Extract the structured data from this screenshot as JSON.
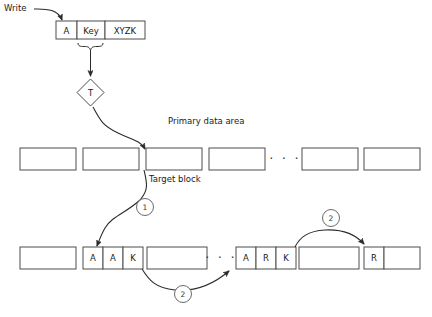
{
  "diagram": {
    "title_labels": {
      "write": "Write",
      "primary_data_area": "Primary data area",
      "target_block": "Target block"
    },
    "input_record": {
      "cells": [
        {
          "label": "A"
        },
        {
          "label": "Key"
        },
        {
          "label": "XYZK"
        }
      ]
    },
    "transform": {
      "label": "T"
    },
    "primary_row": {
      "blocks": [
        "",
        "",
        "",
        "",
        "",
        ""
      ],
      "ellipsis": "· · ·"
    },
    "overflow_row": {
      "ellipsis": "· · ·",
      "group_a": {
        "cells": [
          "A",
          "A",
          "K"
        ]
      },
      "group_b": {
        "cells": [
          "A",
          "R",
          "K"
        ]
      },
      "group_c": {
        "cells": [
          "R"
        ]
      }
    },
    "step_markers": [
      {
        "label": "1"
      },
      {
        "label": "2"
      },
      {
        "label": "2"
      }
    ],
    "colors": {
      "stroke": "#4d4d4d",
      "line": "#2b2b2b",
      "text": "#1a1a1a",
      "background": "#ffffff"
    }
  }
}
